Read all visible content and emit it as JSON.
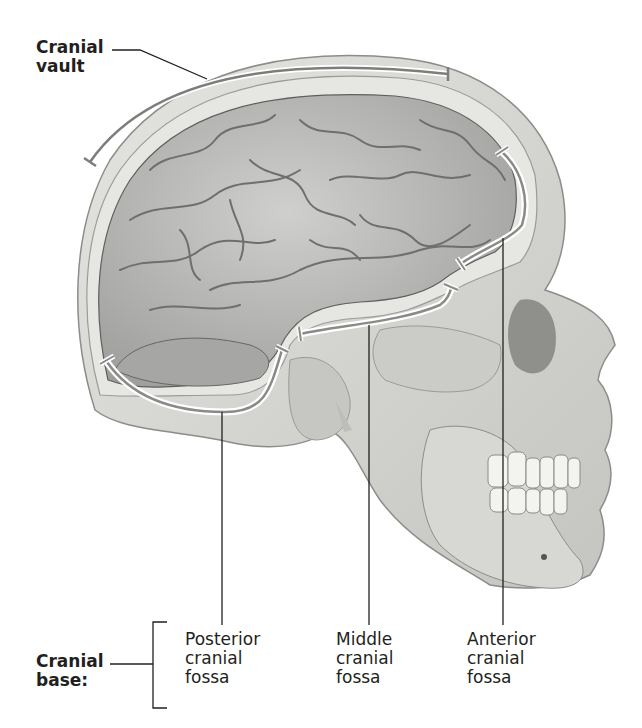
{
  "figure": {
    "type": "anatomical-diagram"
  },
  "labels": {
    "cranial_vault": {
      "line1": "Cranial",
      "line2": "vault"
    },
    "cranial_base": {
      "line1": "Cranial",
      "line2": "base:"
    },
    "posterior": {
      "line1": "Posterior",
      "line2": "cranial",
      "line3": "fossa"
    },
    "middle": {
      "line1": "Middle",
      "line2": "cranial",
      "line3": "fossa"
    },
    "anterior": {
      "line1": "Anterior",
      "line2": "cranial",
      "line3": "fossa"
    }
  },
  "colors": {
    "bone": "#d9d9d6",
    "bone_dark": "#a9a9a6",
    "brain": "#b9b9b7",
    "brain_sulci": "#6f6f6d",
    "leader_line": "#231f20",
    "bracket_outline": "#ffffff",
    "bracket_fill": "#8a8a88"
  }
}
